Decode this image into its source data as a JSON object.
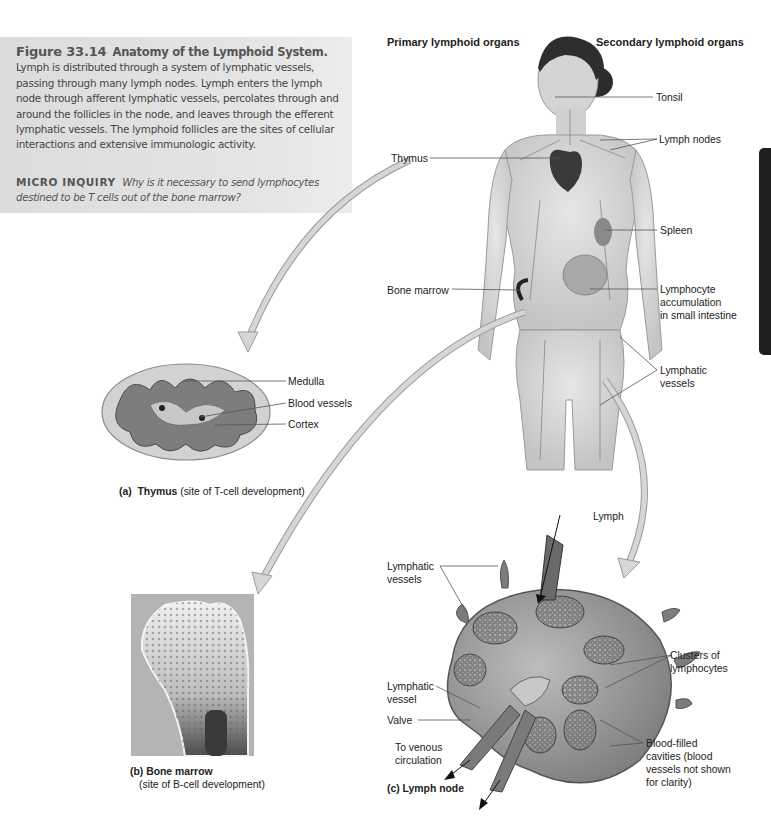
{
  "caption": {
    "figure_number": "Figure 33.14",
    "figure_title": "Anatomy of the Lymphoid System.",
    "body": "Lymph is distributed through a system of lymphatic vessels, passing through many lymph nodes. Lymph enters the lymph node through afferent lymphatic vessels, percolates through and around the follicles in the node, and leaves through the efferent lymphatic vessels. The lymphoid follicles are the sites of cellular interactions and extensive immunologic activity.",
    "inquiry_label": "MICRO INQUIRY",
    "inquiry_question": "Why is it necessary to send lymphocytes destined to be T cells out of the bone marrow?"
  },
  "headers": {
    "primary": "Primary lymphoid organs",
    "secondary": "Secondary lymphoid organs"
  },
  "body_labels": {
    "tonsil": "Tonsil",
    "lymph_nodes": "Lymph nodes",
    "thymus": "Thymus",
    "spleen": "Spleen",
    "bone_marrow": "Bone marrow",
    "lymphocyte_accumulation": [
      "Lymphocyte",
      "accumulation",
      "in small intestine"
    ],
    "lymphatic_vessels": [
      "Lymphatic",
      "vessels"
    ]
  },
  "thymus_panel": {
    "labels": {
      "medulla": "Medulla",
      "blood_vessels": "Blood vessels",
      "cortex": "Cortex"
    },
    "caption_letter": "(a)",
    "caption_name": "Thymus",
    "caption_note": "(site of T-cell development)"
  },
  "bone_marrow_panel": {
    "caption_letter": "(b)",
    "caption_name": "Bone marrow",
    "caption_note": "(site of B-cell development)"
  },
  "lymph_node_panel": {
    "labels": {
      "lymph": "Lymph",
      "lymphatic_vessels": [
        "Lymphatic",
        "vessels"
      ],
      "lymphatic_vessel": [
        "Lymphatic",
        "vessel"
      ],
      "valve": "Valve",
      "to_venous": [
        "To venous",
        "circulation"
      ],
      "clusters": [
        "Clusters of",
        "lymphocytes"
      ],
      "blood_filled": [
        "Blood-filled",
        "cavities (blood",
        "vessels not shown",
        "for clarity)"
      ]
    },
    "caption_letter": "(c)",
    "caption_name": "Lymph node"
  },
  "colors": {
    "caption_bg": "#dcdcdc",
    "arrow_fill": "#d6d6d6",
    "arrow_stroke": "#9a9a9a",
    "leader_line": "#555555",
    "side_tab": "#1e1e1e"
  }
}
